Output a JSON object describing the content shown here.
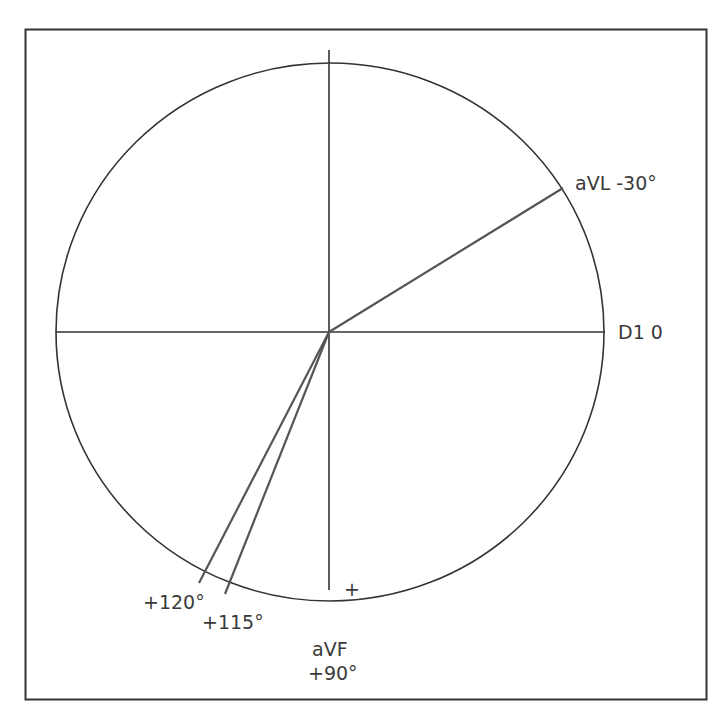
{
  "diagram": {
    "type": "hexaxial-reference-circle",
    "colors": {
      "frame": "#333333",
      "circle": "#333333",
      "axes": "#333333",
      "vectors": "#555555",
      "text": "#3a3a3a"
    },
    "labels": {
      "avl": "aVL  -30°",
      "d1": "D1  0",
      "avf_name": "aVF",
      "avf_angle": "+90°",
      "angle_120": "+120°",
      "angle_115": "+115°",
      "plus_sign": "+"
    },
    "axes": [
      {
        "name": "D1",
        "angle": 0
      },
      {
        "name": "aVL",
        "angle": -30
      },
      {
        "name": "aVF",
        "angle": 90
      },
      {
        "name": "vector-115",
        "angle": 115
      },
      {
        "name": "vector-120",
        "angle": 120
      }
    ]
  }
}
